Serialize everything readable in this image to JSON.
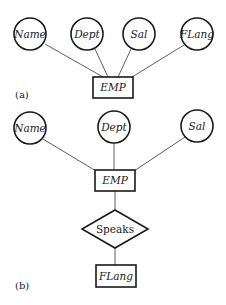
{
  "diagram_a": {
    "caption": "(a)",
    "entity": "EMP",
    "attributes": [
      "Name",
      "Dept",
      "Sal",
      "FLang"
    ]
  },
  "diagram_b": {
    "caption": "(b)",
    "entity": "EMP",
    "attributes": [
      "Name",
      "Dept",
      "Sal"
    ],
    "relationship": "Speaks",
    "related_entity": "FLang"
  }
}
